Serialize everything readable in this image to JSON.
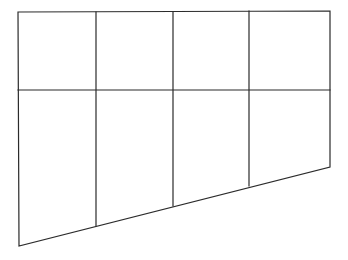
{
  "figure": {
    "type": "grid-shape",
    "background": "#ffffff",
    "stroke_color": "#2b2b2b",
    "outline": {
      "top_left": [
        18,
        12
      ],
      "top_right": [
        330,
        11
      ],
      "bottom_right": [
        330,
        167
      ],
      "bottom_left": [
        19,
        246
      ]
    },
    "horizontal_divider": {
      "y": 90,
      "x_start": 18,
      "x_end": 330
    },
    "vertical_dividers": [
      {
        "x": 96,
        "y_top": 12,
        "y_bottom": 226
      },
      {
        "x": 173,
        "y_top": 12,
        "y_bottom": 206
      },
      {
        "x": 249,
        "y_top": 11,
        "y_bottom": 186
      }
    ],
    "rows": 2,
    "columns": 4
  }
}
